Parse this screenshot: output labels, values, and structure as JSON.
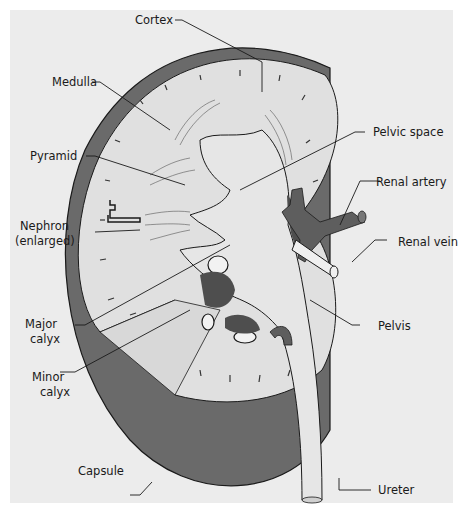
{
  "diagram": {
    "colors": {
      "background": "#ececec",
      "capsule": "#6a6a6a",
      "cortex": "#e0e0e0",
      "pelvis": "#e6e6e6",
      "vessel": "#5e5e5e",
      "outline": "#1a1a1a"
    },
    "labels": {
      "cortex": "Cortex",
      "medulla": "Medulla",
      "pyramid": "Pyramid",
      "nephron_1": "Nephron",
      "nephron_2": "(enlarged)",
      "major_calyx_1": "Major",
      "major_calyx_2": "calyx",
      "minor_calyx_1": "Minor",
      "minor_calyx_2": "calyx",
      "capsule": "Capsule",
      "pelvic_space": "Pelvic space",
      "renal_artery": "Renal artery",
      "renal_vein": "Renal vein",
      "pelvis": "Pelvis",
      "ureter": "Ureter"
    }
  }
}
